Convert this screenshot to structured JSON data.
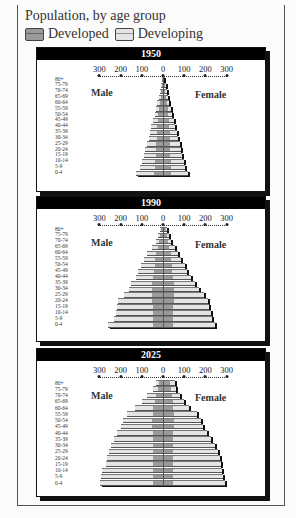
{
  "header": {
    "title": "Population, by age group",
    "legend": [
      {
        "label": "Developed",
        "color": "#9a9a9a"
      },
      {
        "label": "Developing",
        "color": "#e4e4e4"
      }
    ]
  },
  "axis": {
    "ticks": [
      "300",
      "200",
      "100",
      "0",
      "100",
      "200",
      "300"
    ],
    "male_label": "Male",
    "female_label": "Female",
    "age_groups": [
      "80+",
      "75-79",
      "70-74",
      "65-69",
      "60-64",
      "55-59",
      "50-54",
      "45-49",
      "40-44",
      "35-39",
      "30-34",
      "25-29",
      "20-24",
      "15-19",
      "10-14",
      "5-9",
      "0-4"
    ]
  },
  "panels": [
    {
      "year": "1950"
    },
    {
      "year": "1990"
    },
    {
      "year": "2025"
    }
  ],
  "chart_data": [
    {
      "type": "bar",
      "title": "1950",
      "subtitle": "Population, by age group",
      "orientation": "horizontal-population-pyramid",
      "categories": [
        "80+",
        "75-79",
        "70-74",
        "65-69",
        "60-64",
        "55-59",
        "50-54",
        "45-49",
        "40-44",
        "35-39",
        "30-34",
        "25-29",
        "20-24",
        "15-19",
        "10-14",
        "5-9",
        "0-4"
      ],
      "units": "millions",
      "xlim": [
        -300,
        300
      ],
      "xticks": [
        300,
        200,
        100,
        0,
        100,
        200,
        300
      ],
      "legend": [
        "Developed",
        "Developing"
      ],
      "series": [
        {
          "name": "Male Developed",
          "values": [
            3,
            5,
            8,
            11,
            15,
            18,
            22,
            25,
            28,
            30,
            30,
            32,
            35,
            35,
            38,
            40,
            42
          ]
        },
        {
          "name": "Male Developing",
          "values": [
            2,
            4,
            6,
            9,
            12,
            15,
            18,
            22,
            27,
            32,
            38,
            45,
            50,
            55,
            62,
            70,
            85
          ]
        },
        {
          "name": "Female Developed",
          "values": [
            5,
            8,
            11,
            15,
            18,
            22,
            25,
            28,
            30,
            32,
            32,
            33,
            35,
            35,
            37,
            38,
            40
          ]
        },
        {
          "name": "Female Developing",
          "values": [
            2,
            4,
            6,
            9,
            12,
            15,
            18,
            22,
            27,
            32,
            38,
            45,
            50,
            55,
            60,
            68,
            80
          ]
        }
      ]
    },
    {
      "type": "bar",
      "title": "1990",
      "orientation": "horizontal-population-pyramid",
      "categories": [
        "80+",
        "75-79",
        "70-74",
        "65-69",
        "60-64",
        "55-59",
        "50-54",
        "45-49",
        "40-44",
        "35-39",
        "30-34",
        "25-29",
        "20-24",
        "15-19",
        "10-14",
        "5-9",
        "0-4"
      ],
      "units": "millions",
      "xlim": [
        -300,
        300
      ],
      "xticks": [
        300,
        200,
        100,
        0,
        100,
        200,
        300
      ],
      "legend": [
        "Developed",
        "Developing"
      ],
      "series": [
        {
          "name": "Male Developed",
          "values": [
            8,
            12,
            18,
            25,
            35,
            38,
            40,
            42,
            48,
            50,
            52,
            52,
            50,
            48,
            48,
            48,
            48
          ]
        },
        {
          "name": "Male Developing",
          "values": [
            5,
            10,
            15,
            25,
            40,
            50,
            65,
            75,
            80,
            100,
            110,
            130,
            160,
            170,
            175,
            185,
            210
          ]
        },
        {
          "name": "Female Developed",
          "values": [
            15,
            20,
            25,
            30,
            38,
            40,
            42,
            44,
            48,
            50,
            52,
            52,
            50,
            48,
            46,
            46,
            46
          ]
        },
        {
          "name": "Female Developing",
          "values": [
            5,
            10,
            15,
            25,
            35,
            45,
            60,
            70,
            85,
            100,
            120,
            140,
            160,
            170,
            180,
            185,
            200
          ]
        }
      ]
    },
    {
      "type": "bar",
      "title": "2025",
      "orientation": "horizontal-population-pyramid",
      "categories": [
        "80+",
        "75-79",
        "70-74",
        "65-69",
        "60-64",
        "55-59",
        "50-54",
        "45-49",
        "40-44",
        "35-39",
        "30-34",
        "25-29",
        "20-24",
        "15-19",
        "10-14",
        "5-9",
        "0-4"
      ],
      "units": "millions",
      "xlim": [
        -300,
        300
      ],
      "xticks": [
        300,
        200,
        100,
        0,
        100,
        200,
        300
      ],
      "legend": [
        "Developed",
        "Developing"
      ],
      "series": [
        {
          "name": "Male Developed",
          "values": [
            20,
            25,
            35,
            40,
            45,
            48,
            50,
            50,
            48,
            48,
            48,
            48,
            48,
            48,
            48,
            48,
            48
          ]
        },
        {
          "name": "Male Developing",
          "values": [
            15,
            20,
            40,
            60,
            85,
            120,
            140,
            150,
            170,
            185,
            195,
            205,
            215,
            220,
            240,
            245,
            250
          ]
        },
        {
          "name": "Female Developed",
          "values": [
            35,
            38,
            42,
            45,
            48,
            50,
            50,
            50,
            48,
            48,
            48,
            48,
            48,
            48,
            48,
            48,
            48
          ]
        },
        {
          "name": "Female Developing",
          "values": [
            20,
            25,
            40,
            55,
            75,
            110,
            130,
            140,
            160,
            180,
            195,
            210,
            220,
            225,
            230,
            235,
            245
          ]
        }
      ]
    }
  ]
}
